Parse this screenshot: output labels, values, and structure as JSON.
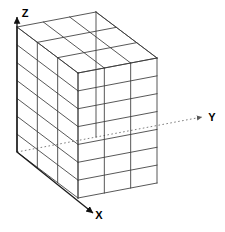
{
  "figure": {
    "kind": "3d-block-mesh-diagram",
    "title": "",
    "background_color": "#ffffff",
    "line_color": "#3a3a3a",
    "face_color": "#ffffff",
    "axis_color": "#1a1a1a",
    "dotted_axis_color": "#808080"
  },
  "axes": [
    {
      "id": "z",
      "label": "Z",
      "direction": "up",
      "style": "solid",
      "arrow": true,
      "label_x": 25,
      "label_y": 17,
      "start_x": 17,
      "start_y": 152,
      "end_x": 17,
      "end_y": 17
    },
    {
      "id": "y",
      "label": "Y",
      "direction": "right-up",
      "style": "dotted",
      "arrow": true,
      "label_x": 212,
      "label_y": 121,
      "start_x": 17,
      "start_y": 152,
      "end_x": 202,
      "end_y": 117
    },
    {
      "id": "x",
      "label": "X",
      "direction": "down-right",
      "style": "solid",
      "arrow": true,
      "label_x": 99,
      "label_y": 219,
      "start_x": 17,
      "start_y": 152,
      "end_x": 93,
      "end_y": 213
    }
  ],
  "mesh": {
    "divisions_x": 3,
    "divisions_y": 3,
    "divisions_z": 7,
    "total_cells": 63,
    "origin_x": 17,
    "origin_y": 152,
    "vec_x_dx": 61,
    "vec_x_dy": 46,
    "vec_y_dx": 79,
    "vec_y_dy": -15,
    "vec_z_dx": 0,
    "vec_z_dy": -125
  }
}
